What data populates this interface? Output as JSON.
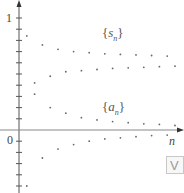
{
  "chart_data": {
    "type": "scatter",
    "title": "",
    "xlabel": "n",
    "ylabel": "",
    "y_tick_labels": [
      "0",
      "1"
    ],
    "xlim": [
      0,
      20
    ],
    "ylim": [
      -0.55,
      1.1
    ],
    "grid": false,
    "legend": "inline labels",
    "series": [
      {
        "name": "{s_n}",
        "label_base": "s",
        "label_sub": "n",
        "x": [
          1,
          2,
          3,
          4,
          5,
          6,
          7,
          8,
          9,
          10,
          11,
          12,
          13,
          14,
          15,
          16,
          17,
          18,
          19,
          20
        ],
        "values": [
          0.84,
          0.42,
          0.76,
          0.48,
          0.72,
          0.52,
          0.7,
          0.53,
          0.69,
          0.54,
          0.68,
          0.55,
          0.675,
          0.555,
          0.67,
          0.56,
          0.665,
          0.565,
          0.66,
          0.57
        ]
      },
      {
        "name": "{a_n}",
        "label_base": "a",
        "label_sub": "n",
        "x": [
          1,
          2,
          3,
          4,
          5,
          6,
          7,
          8,
          9,
          10,
          11,
          12,
          13,
          14,
          15,
          16,
          17,
          18,
          19,
          20
        ],
        "values": [
          -0.5,
          0.32,
          -0.25,
          0.2,
          -0.17,
          0.15,
          -0.13,
          0.11,
          -0.1,
          0.09,
          -0.08,
          0.075,
          -0.07,
          0.065,
          -0.06,
          0.055,
          -0.05,
          0.05,
          -0.045,
          0.04
        ]
      }
    ]
  },
  "axis": {
    "y_label_one": "1",
    "y_label_zero": "0",
    "x_var": "n"
  },
  "labels": {
    "s_base": "s",
    "s_sub": "n",
    "a_base": "a",
    "a_sub": "n",
    "brace_open": "{",
    "brace_close": "}"
  },
  "corner_button": {
    "label": "V"
  },
  "colors": {
    "axis": "#555555",
    "dots": "#666666",
    "text": "#444444"
  }
}
